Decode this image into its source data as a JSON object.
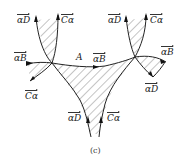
{
  "figure": {
    "caption": "(c)",
    "region_label": "A",
    "labels": {
      "left_top_aD": "αD",
      "left_top_Ca": "Cα",
      "left_aB": "αB",
      "left_Ca": "Cα",
      "center_aB": "αB",
      "right_top_aD": "αD",
      "right_top_Ca": "Cα",
      "right_aB": "αB",
      "right_aD": "αD",
      "bottom_aD": "αD",
      "bottom_Ca": "Cα"
    },
    "colors": {
      "line": "#222222",
      "hatch": "#444444",
      "background": "#ffffff"
    }
  }
}
